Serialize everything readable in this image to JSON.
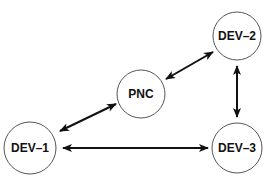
{
  "diagram": {
    "nodes": [
      {
        "id": "pnc",
        "label": "PNC",
        "cx": 141,
        "cy": 94,
        "r": 24
      },
      {
        "id": "dev2",
        "label": "DEV–2",
        "cx": 237,
        "cy": 36,
        "r": 24
      },
      {
        "id": "dev1",
        "label": "DEV–1",
        "cx": 30,
        "cy": 148,
        "r": 26
      },
      {
        "id": "dev3",
        "label": "DEV–3",
        "cx": 237,
        "cy": 148,
        "r": 25
      }
    ],
    "edges": [
      {
        "from": "pnc",
        "to": "dev2",
        "direction": "bidirectional"
      },
      {
        "from": "pnc",
        "to": "dev1",
        "direction": "bidirectional"
      },
      {
        "from": "dev2",
        "to": "dev3",
        "direction": "bidirectional"
      },
      {
        "from": "dev1",
        "to": "dev3",
        "direction": "bidirectional"
      }
    ]
  }
}
